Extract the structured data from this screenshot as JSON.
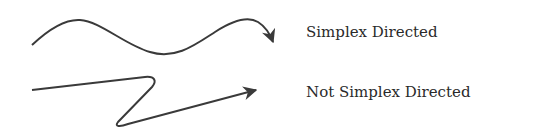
{
  "diagram": {
    "items": [
      {
        "label": "Simplex Directed",
        "curve": "smooth-wave-arrow"
      },
      {
        "label": "Not Simplex Directed",
        "curve": "zigzag-backtrack-arrow"
      }
    ],
    "stroke_color": "#3a3a3a"
  }
}
